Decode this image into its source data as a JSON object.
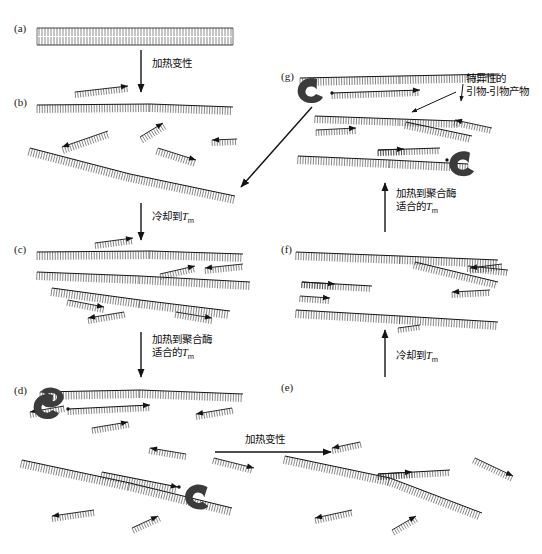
{
  "figure": {
    "background_color": "#ffffff",
    "ink_color": "#141414",
    "enzyme_color": "#3a3a3a",
    "width": 542,
    "height": 554
  },
  "panels": [
    {
      "id": "a",
      "label": "(a)",
      "x": 14,
      "y": 22,
      "description": "intact double-stranded DNA template"
    },
    {
      "id": "b",
      "label": "(b)",
      "x": 14,
      "y": 96,
      "description": "denatured single strands with free primers"
    },
    {
      "id": "c",
      "label": "(c)",
      "x": 14,
      "y": 243,
      "description": "primers annealed to template strands"
    },
    {
      "id": "d",
      "label": "(d)",
      "x": 14,
      "y": 384,
      "description": "polymerase extending primers"
    },
    {
      "id": "e",
      "label": "(e)",
      "x": 281,
      "y": 381,
      "description": "extended products after denaturation"
    },
    {
      "id": "f",
      "label": "(f)",
      "x": 281,
      "y": 243,
      "description": "re-annealed primers on new products"
    },
    {
      "id": "g",
      "label": "(g)",
      "x": 281,
      "y": 70,
      "description": "specific primer-primer products formed"
    }
  ],
  "step_labels": [
    {
      "id": "denature-1",
      "x": 148,
      "y": 58,
      "lines": [
        "加热变性"
      ],
      "meaning": "heat denaturation"
    },
    {
      "id": "cool-tm-1",
      "x": 148,
      "y": 210,
      "lines": [
        "冷却到T_m"
      ],
      "meaning": "cool to Tm"
    },
    {
      "id": "heat-polymerase-1",
      "x": 148,
      "y": 334,
      "lines": [
        "加热到聚合酶",
        "适合的T_m"
      ],
      "meaning": "heat to polymerase-suitable Tm"
    },
    {
      "id": "denature-2",
      "x": 245,
      "y": 430,
      "lines": [
        "加热变性"
      ],
      "meaning": "heat denaturation"
    },
    {
      "id": "cool-tm-2",
      "x": 391,
      "y": 349,
      "lines": [
        "冷却到T_m"
      ],
      "meaning": "cool to Tm"
    },
    {
      "id": "heat-polymerase-2",
      "x": 391,
      "y": 188,
      "lines": [
        "加热到聚合酶",
        "适合的T_m"
      ],
      "meaning": "heat to polymerase-suitable Tm"
    },
    {
      "id": "specific-product",
      "x": 462,
      "y": 74,
      "lines": [
        "特异性的",
        "引物-引物产物"
      ],
      "meaning": "specific primer-primer product"
    }
  ],
  "annotations": {
    "tm_symbol": "T",
    "tm_subscript": "m"
  },
  "arrows": [
    {
      "id": "arrow-a-to-b",
      "direction": "down",
      "x1": 141,
      "y1": 50,
      "x2": 141,
      "y2": 92
    },
    {
      "id": "arrow-b-to-c",
      "direction": "down",
      "x1": 141,
      "y1": 203,
      "x2": 141,
      "y2": 240
    },
    {
      "id": "arrow-c-to-d",
      "direction": "down",
      "x1": 141,
      "y1": 332,
      "x2": 141,
      "y2": 377
    },
    {
      "id": "arrow-d-to-e",
      "direction": "right",
      "x1": 215,
      "y1": 452,
      "x2": 331,
      "y2": 452
    },
    {
      "id": "arrow-e-to-f",
      "direction": "up",
      "x1": 385,
      "y1": 377,
      "x2": 385,
      "y2": 330
    },
    {
      "id": "arrow-f-to-g",
      "direction": "up",
      "x1": 385,
      "y1": 232,
      "x2": 385,
      "y2": 183
    },
    {
      "id": "arrow-b-to-g-diagonal",
      "direction": "down-left",
      "x1": 312,
      "y1": 107,
      "x2": 240,
      "y2": 188
    },
    {
      "id": "pointer-specific-product",
      "direction": "down-left",
      "x1": 455,
      "y1": 92,
      "x2": 410,
      "y2": 113
    },
    {
      "id": "pointer-specific-product-2",
      "direction": "down",
      "x1": 465,
      "y1": 86,
      "x2": 462,
      "y2": 100
    }
  ],
  "legend": {
    "enzyme_name": "DNA polymerase",
    "strand_name": "DNA strand",
    "primer_name": "primer"
  }
}
